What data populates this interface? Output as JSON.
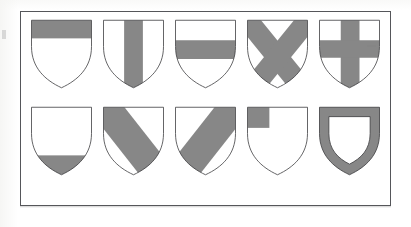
{
  "figure": {
    "rows": 2,
    "columns": 5,
    "background_color": "#ffffff",
    "frame_color": "#55565a",
    "field_color": "#ffffff",
    "charge_color": "#878787",
    "outline_color": "#3a3a3c"
  },
  "shields": [
    {
      "index": 1,
      "row": 1,
      "column": 1,
      "ordinary": "chief",
      "label": "chief",
      "description": "Horizontal band across the top of the shield",
      "charge_color": "#878787",
      "field_color": "#ffffff"
    },
    {
      "index": 2,
      "row": 1,
      "column": 2,
      "ordinary": "pale",
      "label": "pale",
      "description": "Vertical band down the centre of the shield",
      "charge_color": "#878787",
      "field_color": "#ffffff"
    },
    {
      "index": 3,
      "row": 1,
      "column": 3,
      "ordinary": "fess",
      "label": "fess",
      "description": "Horizontal band across the middle of the shield",
      "charge_color": "#878787",
      "field_color": "#ffffff"
    },
    {
      "index": 4,
      "row": 1,
      "column": 4,
      "ordinary": "saltire",
      "label": "saltire",
      "description": "Diagonal cross in the form of an X",
      "charge_color": "#878787",
      "field_color": "#ffffff"
    },
    {
      "index": 5,
      "row": 1,
      "column": 5,
      "ordinary": "cross",
      "label": "cross",
      "description": "Upright cross with vertical and horizontal arms",
      "charge_color": "#878787",
      "field_color": "#ffffff"
    },
    {
      "index": 6,
      "row": 2,
      "column": 1,
      "ordinary": "base",
      "label": "base",
      "description": "Horizontal band across the bottom point of the shield",
      "charge_color": "#878787",
      "field_color": "#ffffff"
    },
    {
      "index": 7,
      "row": 2,
      "column": 2,
      "ordinary": "bend",
      "label": "bend",
      "description": "Diagonal band from upper left to lower right",
      "charge_color": "#878787",
      "field_color": "#ffffff"
    },
    {
      "index": 8,
      "row": 2,
      "column": 3,
      "ordinary": "bend-sinister",
      "label": "bend sinister",
      "description": "Diagonal band from upper right to lower left",
      "charge_color": "#878787",
      "field_color": "#ffffff"
    },
    {
      "index": 9,
      "row": 2,
      "column": 4,
      "ordinary": "canton",
      "label": "canton",
      "description": "Square charge in the upper left corner of the shield",
      "charge_color": "#878787",
      "field_color": "#ffffff"
    },
    {
      "index": 10,
      "row": 2,
      "column": 5,
      "ordinary": "bordure",
      "label": "bordure",
      "description": "Border running around the entire edge of the shield",
      "charge_color": "#878787",
      "field_color": "#ffffff"
    }
  ],
  "artifacts": {
    "scan_smudge": "faint gray mark in upper right quadrant of cross shield",
    "edge_mark": "faint gray mark at left paper edge"
  }
}
